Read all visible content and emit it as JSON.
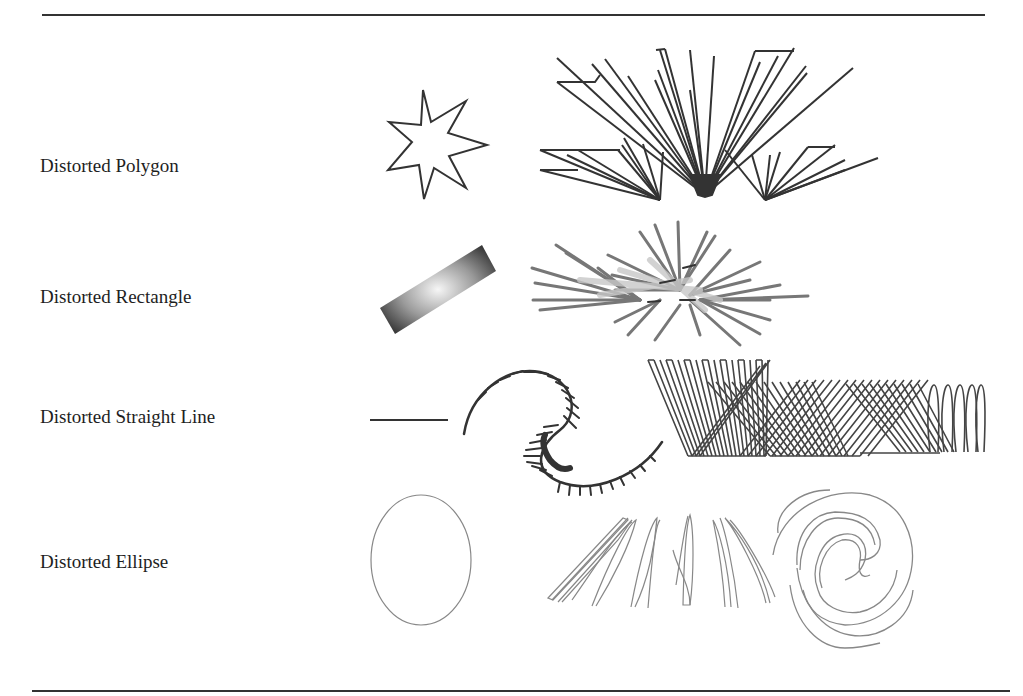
{
  "figure": {
    "rows": [
      {
        "label": "Distorted Polygon"
      },
      {
        "label": "Distorted Rectangle"
      },
      {
        "label": "Distorted Straight Line"
      },
      {
        "label": "Distorted Ellipse"
      }
    ],
    "colors": {
      "ink": "#333333",
      "ellipse_ink": "#777777",
      "gradient_dark": "#3a3a3a",
      "gradient_light": "#f4f4f4"
    }
  }
}
